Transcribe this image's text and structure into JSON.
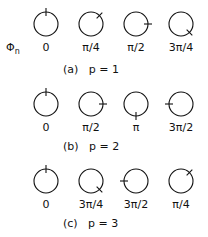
{
  "symbol": {
    "text": "Φn",
    "x": 6,
    "y": 42
  },
  "rows": [
    {
      "caption": "(a)   p = 1",
      "caption_x": 63,
      "caption_y": 64,
      "circle_y": 24,
      "label_y": 42,
      "items": [
        {
          "label": "0",
          "angle_deg": 0,
          "x": 46
        },
        {
          "label": "π/4",
          "angle_deg": 45,
          "x": 91
        },
        {
          "label": "π/2",
          "angle_deg": 90,
          "x": 136
        },
        {
          "label": "3π/4",
          "angle_deg": 135,
          "x": 181
        }
      ]
    },
    {
      "caption": "(b)   p = 2",
      "caption_x": 63,
      "caption_y": 141,
      "circle_y": 104,
      "label_y": 122,
      "items": [
        {
          "label": "0",
          "angle_deg": 0,
          "x": 46
        },
        {
          "label": "π/2",
          "angle_deg": 90,
          "x": 91
        },
        {
          "label": "π",
          "angle_deg": 180,
          "x": 136
        },
        {
          "label": "3π/2",
          "angle_deg": 270,
          "x": 181
        }
      ]
    },
    {
      "caption": "(c)   p = 3",
      "caption_x": 63,
      "caption_y": 218,
      "circle_y": 181,
      "label_y": 199,
      "items": [
        {
          "label": "0",
          "angle_deg": 0,
          "x": 46
        },
        {
          "label": "3π/4",
          "angle_deg": 135,
          "x": 91
        },
        {
          "label": "3π/2",
          "angle_deg": 270,
          "x": 136
        },
        {
          "label": "π/4",
          "angle_deg": 45,
          "x": 181
        }
      ]
    }
  ],
  "style": {
    "radius": 12,
    "tick_len": 4,
    "stroke": "#111111"
  }
}
